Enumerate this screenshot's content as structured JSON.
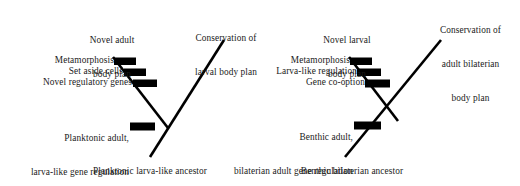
{
  "figure": {
    "ink_color": "#000000",
    "text_color": "#1a1a1a",
    "background_color": "#ffffff"
  },
  "panels": [
    {
      "id": "left-panel",
      "name": "planktonic-larva-like-ancestor-scenario",
      "root_label": "Planktonic larva-like ancestor",
      "upper_branch_label": "Novel adult\nbody plan",
      "upper_branch_label_line1": "Novel adult",
      "upper_branch_label_line2": "body plan",
      "main_branch_label_line1": "Conservation of",
      "main_branch_label_line2": "larval body plan",
      "derived_events": [
        {
          "label": "Metamorphosis"
        },
        {
          "label": "Set aside cells"
        },
        {
          "label": "Novel regulatory genes"
        }
      ],
      "stem_event": {
        "label_line1": "Planktonic adult,",
        "label_line2": "larva-like gene regulation"
      }
    },
    {
      "id": "right-panel",
      "name": "benthic-bilaterian-ancestor-scenario",
      "root_label": "Benthic bilaterian ancestor",
      "upper_branch_label_line1": "Novel larval",
      "upper_branch_label_line2": "body plan",
      "main_branch_label_line1": "Conservation of",
      "main_branch_label_line2": "adult bilaterian",
      "main_branch_label_line3": "body plan",
      "derived_events": [
        {
          "label": "Metamorphosis"
        },
        {
          "label": "Larva-like regulation"
        },
        {
          "label": "Gene co-option"
        }
      ],
      "stem_event": {
        "label_line1": "Benthic adult,",
        "label_line2": "bilaterian adult gene regulation"
      }
    }
  ]
}
